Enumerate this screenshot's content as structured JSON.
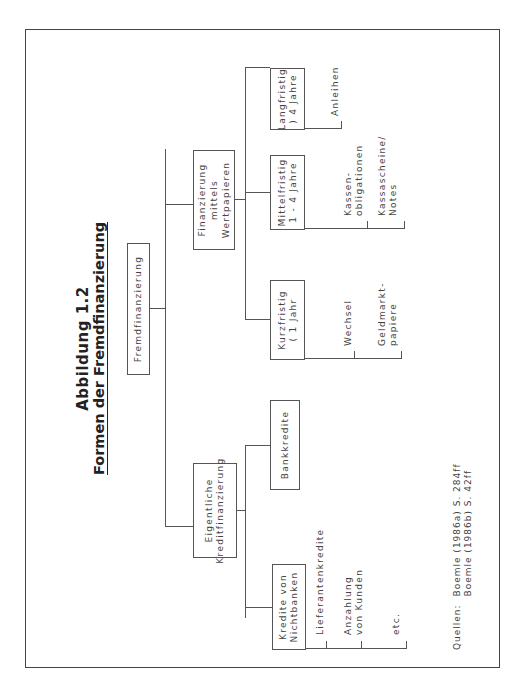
{
  "figure": {
    "label": "Abbildung 1.2",
    "title": "Formen der Fremdfinanzierung"
  },
  "tree": {
    "root": "Fremdfinanzierung",
    "branches": [
      {
        "label_lines": [
          "Eigentliche",
          "Kreditfinanzierung"
        ],
        "children": [
          {
            "label_lines": [
              "Kredite von",
              "Nichtbanken"
            ],
            "items": [
              {
                "lines": [
                  "Lieferantenkredite"
                ]
              },
              {
                "lines": [
                  "Anzahlung",
                  "von Kunden"
                ]
              },
              {
                "lines": [
                  "etc."
                ]
              }
            ]
          },
          {
            "label_lines": [
              "Bankkredite"
            ],
            "items": []
          }
        ]
      },
      {
        "label_lines": [
          "Finanzierung",
          "mittels",
          "Wertpapieren"
        ],
        "children": [
          {
            "label_lines": [
              "Kurzfristig",
              "( 1 Jahr"
            ],
            "items": [
              {
                "lines": [
                  "Wechsel"
                ]
              },
              {
                "lines": [
                  "Geldmarkt-",
                  "papiere"
                ]
              }
            ]
          },
          {
            "label_lines": [
              "Mittelfristig",
              "1 - 4 Jahre"
            ],
            "items": [
              {
                "lines": [
                  "Kassen-",
                  "obligationen"
                ]
              },
              {
                "lines": [
                  "Kassascheine/",
                  "Notes"
                ]
              }
            ]
          },
          {
            "label_lines": [
              "Langfristig",
              ") 4 Jahre"
            ],
            "items": [
              {
                "lines": [
                  "Anleihen"
                ]
              }
            ]
          }
        ]
      }
    ]
  },
  "source": {
    "label": "Quellen:",
    "refs": [
      "Boemle (1986a) S. 284ff",
      "Boemle (1986b) S. 42ff"
    ]
  }
}
